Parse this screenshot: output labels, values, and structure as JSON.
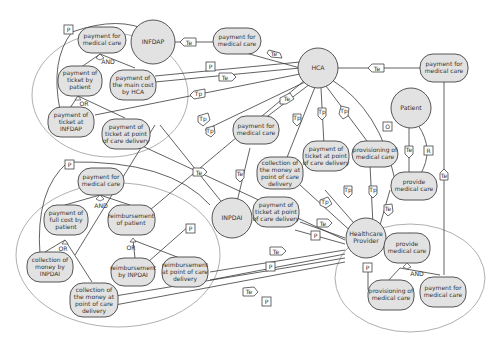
{
  "actors": {
    "infdap": "INFDAP",
    "hca": "HCA",
    "patient": "Patient",
    "inpdai": "INPDAI",
    "provider_l1": "Healthcare",
    "provider_l2": "Provider"
  },
  "goals": {
    "infdap_pay": [
      "payment for",
      "medical care"
    ],
    "infdap_ticket_patient": [
      "payment of",
      "ticket by",
      "patient"
    ],
    "infdap_main_cost": [
      "payment of",
      "the main cost",
      "by HCA"
    ],
    "infdap_ticket_infdap": [
      "payment of",
      "ticket at",
      "INFDAP"
    ],
    "infdap_ticket_pocd": [
      "payment of",
      "ticket at point",
      "of care delivery"
    ],
    "dep_infdap_hca": [
      "payment for",
      "medical care"
    ],
    "hca_patient_pay": [
      "payment for",
      "medical care"
    ],
    "mid_pay": [
      "payment for",
      "medical care"
    ],
    "mid_collection": [
      "collection of",
      "the money at",
      "point of care",
      "delivery"
    ],
    "mid_ticket": [
      "payment of",
      "ticket at point",
      "of care delivery"
    ],
    "mid_provisioning": [
      "provisioning of",
      "medical care"
    ],
    "mid_ticket2": [
      "payment of",
      "ticket at point",
      "of care delivery"
    ],
    "patient_provide": [
      "provide",
      "medical care"
    ],
    "inpdai_pay": [
      "payment for",
      "medical care"
    ],
    "inpdai_full_cost": [
      "payment of",
      "full cost by",
      "patient"
    ],
    "inpdai_reimb_patient": [
      "reimbursement",
      "of patient"
    ],
    "inpdai_collection": [
      "collection of",
      "money by",
      "INPDAI"
    ],
    "inpdai_reimb_by": [
      "reimbursement",
      "by INPDAI"
    ],
    "inpdai_reimb_pocd": [
      "reimbursement",
      "at point of care",
      "delivery"
    ],
    "inpdai_collection_pocd": [
      "collection of",
      "the money at",
      "point of care",
      "delivery"
    ],
    "prov_provide": [
      "provide",
      "medical care"
    ],
    "prov_provisioning": [
      "provisioning of",
      "medical care"
    ],
    "prov_pay": [
      "payment for",
      "medical care"
    ]
  },
  "operators": {
    "and1": "AND",
    "or1": "OR",
    "and2": "AND",
    "or2": "OR",
    "or3": "OR",
    "and3": "AND"
  },
  "tags": {
    "P": "P",
    "Te": "Te",
    "Tp": "Tp",
    "O": "O",
    "R": "R"
  }
}
